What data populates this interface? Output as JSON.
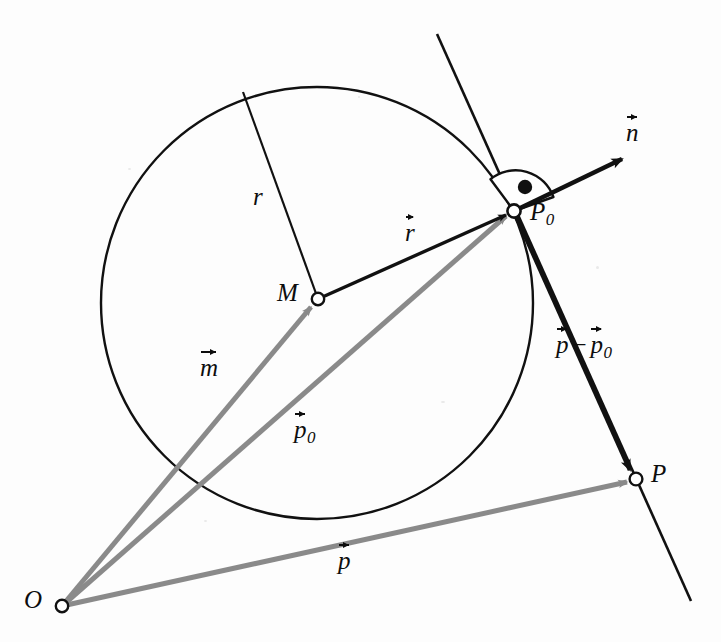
{
  "figure": {
    "background_color": "#fdfdfd",
    "stroke_color": "#111111",
    "gray_vector_color": "#8a8a8a",
    "width": 721,
    "height": 642
  },
  "labels": {
    "origin": "O",
    "center": "M",
    "radius": "r",
    "point_p0": "P",
    "point_p0_sub": "0",
    "point_p": "P",
    "vec_n": "n",
    "vec_r": "r",
    "vec_m": "m",
    "vec_p": "p",
    "vec_p0": "p",
    "vec_p0_sub": "0",
    "vec_diff_lead": "p",
    "vec_diff_minus": "−",
    "vec_diff_trail": "p",
    "vec_diff_trail_sub": "0"
  },
  "geometry": {
    "circle": {
      "cx": 317,
      "cy": 303,
      "r": 216
    },
    "points": {
      "O": {
        "x": 62,
        "y": 606
      },
      "M": {
        "x": 318,
        "y": 299
      },
      "P0": {
        "x": 514,
        "y": 211
      },
      "P": {
        "x": 636,
        "y": 479
      },
      "radius_rim": {
        "x": 243,
        "y": 92
      },
      "n_tip": {
        "x": 629,
        "y": 155
      },
      "tangent_start": {
        "x": 437,
        "y": 34
      },
      "tangent_end": {
        "x": 691,
        "y": 601
      }
    },
    "angle_marker": {
      "center_x": 514,
      "center_y": 211,
      "radius": 40,
      "dot_x": 525,
      "dot_y": 186,
      "dot_r": 7
    }
  },
  "label_positions": {
    "origin": {
      "x": 24,
      "y": 587
    },
    "center": {
      "x": 277,
      "y": 280
    },
    "radius": {
      "x": 253,
      "y": 184
    },
    "point_p0": {
      "x": 530,
      "y": 199
    },
    "point_p": {
      "x": 651,
      "y": 461
    },
    "vec_n": {
      "x": 626,
      "y": 118
    },
    "vec_r": {
      "x": 405,
      "y": 218
    },
    "vec_m": {
      "x": 200,
      "y": 353
    },
    "vec_p": {
      "x": 338,
      "y": 546
    },
    "vec_p0": {
      "x": 294,
      "y": 415
    },
    "vec_diff": {
      "x": 556,
      "y": 330
    }
  }
}
